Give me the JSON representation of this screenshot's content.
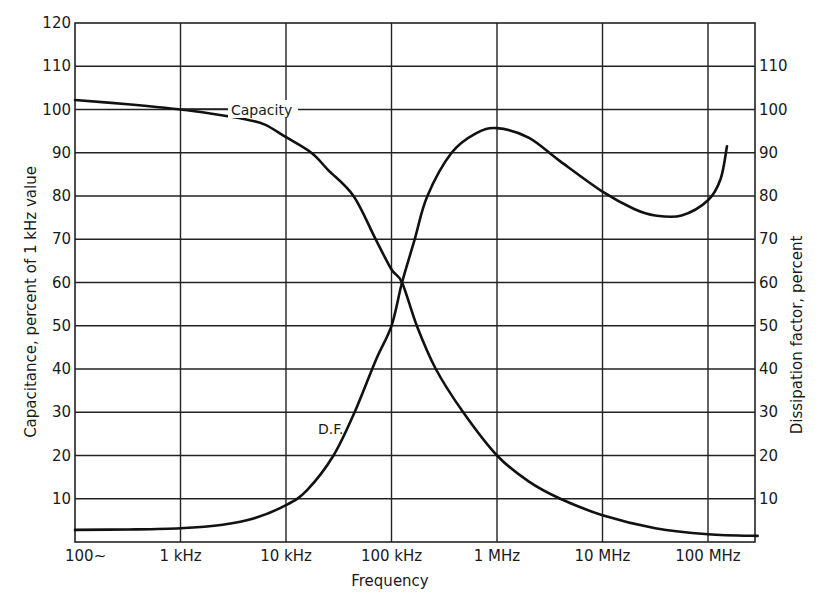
{
  "chart_data": {
    "type": "line",
    "title": "",
    "xlabel": "Frequency",
    "ylabel": "Capacitance, percent of 1 kHz value",
    "ylabel_right": "Dissipation factor, percent",
    "x_scale": "log",
    "x_tick_labels": [
      "100~",
      "1 kHz",
      "10 kHz",
      "100 kHz",
      "1 MHz",
      "10 MHz",
      "100 MHz"
    ],
    "x_tick_values_hz": [
      100,
      1000,
      10000,
      100000,
      1000000,
      10000000,
      100000000
    ],
    "xlim_hz": [
      100,
      300000000
    ],
    "y_left_ticks": [
      10,
      20,
      30,
      40,
      50,
      60,
      70,
      80,
      90,
      100,
      110,
      120
    ],
    "y_right_ticks": [
      10,
      20,
      30,
      40,
      50,
      60,
      70,
      80,
      90,
      100,
      110
    ],
    "ylim": [
      0,
      120
    ],
    "grid": true,
    "series": [
      {
        "name": "Capacity",
        "axis": "left",
        "label_text": "Capacity",
        "points_log10_hz": [
          [
            2.0,
            102.2
          ],
          [
            2.5,
            101.2
          ],
          [
            3.0,
            100.0
          ],
          [
            3.3,
            99.0
          ],
          [
            3.6,
            97.8
          ],
          [
            3.8,
            96.5
          ],
          [
            4.0,
            93.6
          ],
          [
            4.24,
            90.0
          ],
          [
            4.4,
            86.0
          ],
          [
            4.64,
            80.0
          ],
          [
            4.85,
            70.0
          ],
          [
            5.0,
            63.0
          ],
          [
            5.1,
            60.0
          ],
          [
            5.24,
            50.0
          ],
          [
            5.42,
            40.0
          ],
          [
            5.68,
            30.0
          ],
          [
            6.0,
            20.0
          ],
          [
            6.3,
            14.0
          ],
          [
            6.6,
            10.0
          ],
          [
            7.0,
            6.2
          ],
          [
            7.5,
            3.2
          ],
          [
            8.0,
            1.8
          ],
          [
            8.47,
            1.4
          ]
        ]
      },
      {
        "name": "D.F.",
        "axis": "right",
        "label_text": "D.F.",
        "points_log10_hz": [
          [
            2.0,
            2.8
          ],
          [
            2.5,
            2.9
          ],
          [
            3.0,
            3.2
          ],
          [
            3.4,
            4.0
          ],
          [
            3.7,
            5.5
          ],
          [
            4.0,
            8.5
          ],
          [
            4.2,
            12.0
          ],
          [
            4.45,
            20.0
          ],
          [
            4.65,
            30.0
          ],
          [
            4.85,
            42.0
          ],
          [
            5.0,
            50.0
          ],
          [
            5.1,
            60.0
          ],
          [
            5.22,
            70.0
          ],
          [
            5.34,
            80.0
          ],
          [
            5.57,
            90.0
          ],
          [
            5.8,
            94.5
          ],
          [
            6.0,
            95.7
          ],
          [
            6.3,
            93.5
          ],
          [
            6.6,
            88.0
          ],
          [
            7.0,
            81.0
          ],
          [
            7.3,
            77.0
          ],
          [
            7.5,
            75.5
          ],
          [
            7.75,
            75.5
          ],
          [
            8.0,
            79.0
          ],
          [
            8.12,
            84.0
          ],
          [
            8.18,
            91.5
          ]
        ]
      }
    ]
  },
  "labels": {
    "x_axis_title": "Frequency",
    "y_left_title": "Capacitance, percent of 1 kHz value",
    "y_right_title": "Dissipation factor, percent",
    "capacity_label": "Capacity",
    "df_label": "D.F."
  }
}
